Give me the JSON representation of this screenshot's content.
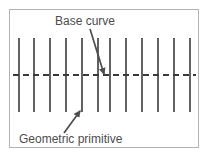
{
  "figure": {
    "width": 210,
    "height": 159,
    "background_color": "#ffffff",
    "frame": {
      "border_color": "#b3b3b3",
      "x": 9,
      "y": 9,
      "width": 190,
      "height": 139
    },
    "labels": {
      "base_curve": "Base curve",
      "geometric_primitive": "Geometric primitive",
      "text_color": "#4d4d4d",
      "font_size_px": 12
    },
    "base_curve": {
      "style": "dashed",
      "color": "#3a3a3a",
      "stroke_width": 2,
      "dash_length": 6,
      "gap_length": 4,
      "y": 75,
      "x_start": 13,
      "x_end": 196
    },
    "primitives": {
      "count": 12,
      "color": "#3a3a3a",
      "stroke_width": 1.6,
      "y_top": 38,
      "y_bottom": 112,
      "x_positions": [
        19,
        34,
        50,
        66,
        82,
        98,
        110,
        126,
        142,
        158,
        174,
        190
      ]
    },
    "annotations": [
      {
        "name": "base-curve-arrow",
        "from_x": 90,
        "from_y": 29,
        "to_x": 104,
        "to_y": 74,
        "color": "#4d4d4d"
      },
      {
        "name": "geometric-primitive-arrow",
        "from_x": 64,
        "from_y": 133,
        "to_x": 80,
        "to_y": 111,
        "color": "#4d4d4d"
      }
    ]
  }
}
